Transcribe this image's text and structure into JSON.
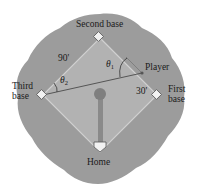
{
  "diagram": {
    "type": "baseball-diamond",
    "colors": {
      "outfield": "#9c9c9c",
      "infield": "#b2b2b2",
      "infield_border": "#d0d0d0",
      "base_fill": "#f2f2f2",
      "base_stroke": "#555555",
      "line": "#555555",
      "mound": "#7f7f7f",
      "path": "#8a8a8a",
      "text": "#1a1a1a"
    },
    "labels": {
      "second_base": "Second base",
      "third_base_line1": "Third",
      "third_base_line2": "base",
      "first_base_line1": "First",
      "first_base_line2": "base",
      "home": "Home",
      "player": "Player",
      "side_length": "90'",
      "player_distance": "30'",
      "theta1_symbol": "θ",
      "theta1_sub": "1",
      "theta2_symbol": "θ",
      "theta2_sub": "2"
    }
  }
}
